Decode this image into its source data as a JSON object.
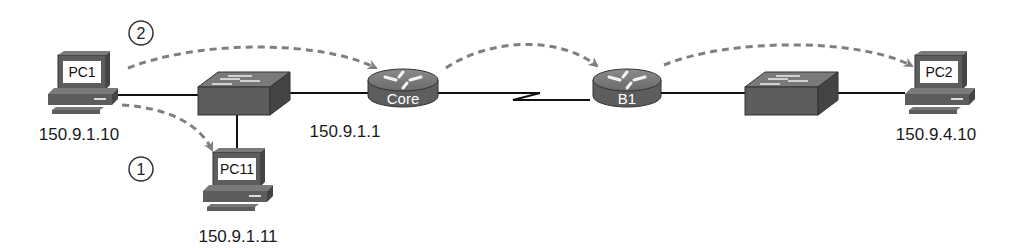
{
  "diagram": {
    "devices": [
      {
        "id": "pc1",
        "type": "pc",
        "label": "PC1",
        "address": "150.9.1.10"
      },
      {
        "id": "pc11",
        "type": "pc",
        "label": "PC11",
        "address": "150.9.1.11"
      },
      {
        "id": "switch1",
        "type": "switch",
        "label": ""
      },
      {
        "id": "core",
        "type": "router",
        "label": "Core",
        "address": "150.9.1.1"
      },
      {
        "id": "b1",
        "type": "router",
        "label": "B1"
      },
      {
        "id": "switch2",
        "type": "switch",
        "label": ""
      },
      {
        "id": "pc2",
        "type": "pc",
        "label": "PC2",
        "address": "150.9.4.10"
      }
    ],
    "steps": [
      {
        "number": "1",
        "description": "PC1 to PC11"
      },
      {
        "number": "2",
        "description": "PC1 to Core to B1 to PC2"
      }
    ],
    "colors": {
      "device": "#5a5a5a",
      "device_top": "#7a7a7a",
      "link": "#111111",
      "flow_arrow": "#7f7f7f"
    }
  }
}
